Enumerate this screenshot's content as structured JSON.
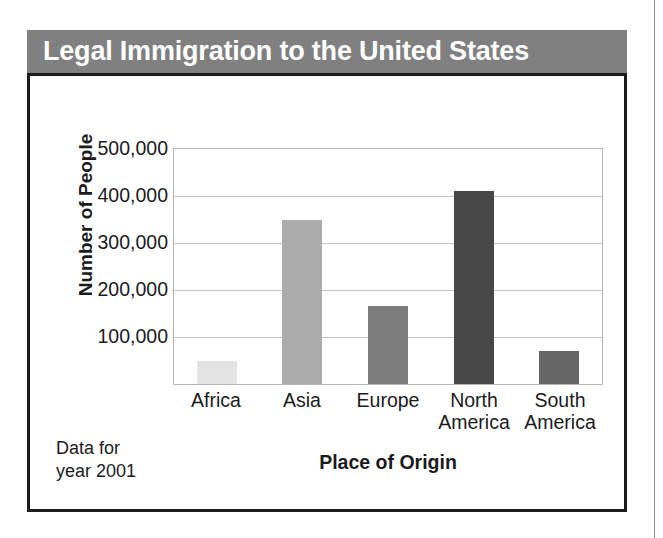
{
  "figure": {
    "title": "Legal Immigration to the United States",
    "source_note": "Data for\nyear 2001"
  },
  "colors": {
    "title_band": "#808080",
    "title_text": "#ffffff",
    "frame_border": "#1b1b1b",
    "plot_border": "#b5b5b5",
    "gridline": "#c4c4c4",
    "text": "#1b1b1b"
  },
  "chart_data": {
    "type": "bar",
    "title": "Legal Immigration to the United States",
    "xlabel": "Place of Origin",
    "ylabel": "Number of People",
    "categories": [
      "Africa",
      "Asia",
      "Europe",
      "North America",
      "South America"
    ],
    "values": [
      50000,
      350000,
      167000,
      410000,
      70000
    ],
    "bar_colors": [
      "#e3e3e3",
      "#ababab",
      "#7d7d7d",
      "#474747",
      "#666666"
    ],
    "ylim": [
      0,
      500000
    ],
    "ytick_values": [
      100000,
      200000,
      300000,
      400000,
      500000
    ],
    "ytick_labels": [
      "100,000",
      "200,000",
      "300,000",
      "400,000",
      "500,000"
    ],
    "grid": true,
    "legend": false,
    "annotation": "Data for year 2001"
  }
}
